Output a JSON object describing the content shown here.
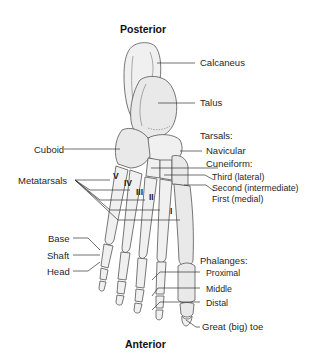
{
  "diagram": {
    "orientation": {
      "top": "Posterior",
      "bottom": "Anterior"
    },
    "labels": {
      "calcaneus": "Calcaneus",
      "talus": "Talus",
      "tarsals_header": "Tarsals:",
      "navicular": "Navicular",
      "cuneiform_header": "Cuneiform:",
      "cuneiform_third": "Third (lateral)",
      "cuneiform_second": "Second (intermediate)",
      "cuneiform_first": "First (medial)",
      "cuboid": "Cuboid",
      "metatarsals": "Metatarsals",
      "base": "Base",
      "shaft": "Shaft",
      "head": "Head",
      "phalanges_header": "Phalanges:",
      "proximal": "Proximal",
      "middle": "Middle",
      "distal": "Distal",
      "great_toe": "Great (big) toe"
    },
    "metatarsal_numerals": [
      "V",
      "IV",
      "III",
      "II",
      "I"
    ],
    "colors": {
      "bone_fill": "#e9e9e9",
      "bone_outline": "#555555",
      "leader_line": "#333333",
      "text": "#1f1f1f",
      "background": "#ffffff"
    }
  }
}
